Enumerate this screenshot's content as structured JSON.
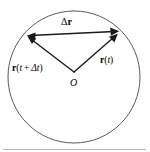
{
  "figure": {
    "name": "displacement-vector-circular-motion",
    "background_color": "#ffffff",
    "stroke_color": "#1a1a1a",
    "circle_color": "#5a5a5a",
    "rule_color": "#b8b8b8",
    "width": 150,
    "height": 152
  },
  "circle": {
    "name": "trajectory-circle",
    "center_x": 74,
    "center_y": 77,
    "radius": 66,
    "stroke_width": 1
  },
  "origin": {
    "label": "O",
    "x": 74,
    "y": 72
  },
  "vectors": [
    {
      "id": "r-t-dt",
      "label_plain": "r(t + Δt)",
      "label_bold_part": "r",
      "label_paren_open": "(",
      "label_t": "t",
      "label_plus": " + ",
      "label_delta": "Δ",
      "label_t2": "t",
      "label_paren_close": ")",
      "from_x": 74,
      "from_y": 72,
      "to_x": 28,
      "to_y": 37,
      "arrow": "end"
    },
    {
      "id": "r-t",
      "label_plain": "r(t)",
      "label_bold_part": "r",
      "label_paren_open": "(",
      "label_t": "t",
      "label_paren_close": ")",
      "from_x": 74,
      "from_y": 72,
      "to_x": 117,
      "to_y": 34,
      "arrow": "end"
    },
    {
      "id": "delta-r",
      "label_plain": "Δr",
      "label_delta": "Δ",
      "label_bold_part": "r",
      "from_x": 28,
      "from_y": 36,
      "to_x": 118,
      "to_y": 31,
      "arrow": "both"
    }
  ],
  "labels": {
    "delta_r": {
      "delta": "Δ",
      "vector": "r"
    },
    "r_t_plus_dt": {
      "vector": "r",
      "open": "(",
      "t": "t",
      "plus": "+",
      "delta": "Δ",
      "t2": "t",
      "close": ")"
    },
    "r_t": {
      "vector": "r",
      "open": "(",
      "t": "t",
      "close": ")"
    },
    "origin": "O"
  }
}
